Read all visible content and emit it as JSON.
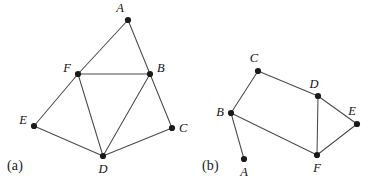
{
  "figure": {
    "width": 369,
    "height": 185,
    "background_color": "#ffffff",
    "edge_color": "#4a4a4a",
    "vertex_color": "#1a1a1a",
    "label_color": "#111111"
  },
  "panels": [
    {
      "id": "panel-a",
      "caption": "(a)",
      "caption_position": {
        "x": 7,
        "y": 158
      },
      "vertices": [
        {
          "id": "A",
          "label": "A",
          "x": 128,
          "y": 20,
          "label_x": 124,
          "label_y": 12,
          "label_anchor": "end"
        },
        {
          "id": "F",
          "label": "F",
          "x": 78,
          "y": 74,
          "label_x": 71,
          "label_y": 72,
          "label_anchor": "end"
        },
        {
          "id": "B",
          "label": "B",
          "x": 150,
          "y": 74,
          "label_x": 157,
          "label_y": 72,
          "label_anchor": "start"
        },
        {
          "id": "E",
          "label": "E",
          "x": 34,
          "y": 126,
          "label_x": 27,
          "label_y": 124,
          "label_anchor": "end"
        },
        {
          "id": "C",
          "label": "C",
          "x": 172,
          "y": 128,
          "label_x": 179,
          "label_y": 132,
          "label_anchor": "start"
        },
        {
          "id": "D",
          "label": "D",
          "x": 103,
          "y": 156,
          "label_x": 103,
          "label_y": 173,
          "label_anchor": "middle"
        }
      ],
      "edges": [
        {
          "from": "A",
          "to": "F"
        },
        {
          "from": "A",
          "to": "B"
        },
        {
          "from": "F",
          "to": "B"
        },
        {
          "from": "F",
          "to": "E"
        },
        {
          "from": "F",
          "to": "D"
        },
        {
          "from": "B",
          "to": "D"
        },
        {
          "from": "B",
          "to": "C"
        },
        {
          "from": "E",
          "to": "D"
        },
        {
          "from": "D",
          "to": "C"
        }
      ]
    },
    {
      "id": "panel-b",
      "caption": "(b)",
      "caption_position": {
        "x": 202,
        "y": 158
      },
      "vertices": [
        {
          "id": "C",
          "label": "C",
          "x": 258,
          "y": 71,
          "label_x": 254,
          "label_y": 62,
          "label_anchor": "middle"
        },
        {
          "id": "B",
          "label": "B",
          "x": 231,
          "y": 113,
          "label_x": 224,
          "label_y": 116,
          "label_anchor": "end"
        },
        {
          "id": "D",
          "label": "D",
          "x": 318,
          "y": 96,
          "label_x": 314,
          "label_y": 88,
          "label_anchor": "middle"
        },
        {
          "id": "E",
          "label": "E",
          "x": 357,
          "y": 124,
          "label_x": 352,
          "label_y": 115,
          "label_anchor": "middle"
        },
        {
          "id": "F",
          "label": "F",
          "x": 317,
          "y": 155,
          "label_x": 317,
          "label_y": 172,
          "label_anchor": "middle"
        },
        {
          "id": "A",
          "label": "A",
          "x": 244,
          "y": 159,
          "label_x": 244,
          "label_y": 176,
          "label_anchor": "middle"
        }
      ],
      "edges": [
        {
          "from": "B",
          "to": "C"
        },
        {
          "from": "C",
          "to": "D"
        },
        {
          "from": "D",
          "to": "E"
        },
        {
          "from": "D",
          "to": "F"
        },
        {
          "from": "E",
          "to": "F"
        },
        {
          "from": "B",
          "to": "F"
        },
        {
          "from": "B",
          "to": "A"
        }
      ]
    }
  ]
}
